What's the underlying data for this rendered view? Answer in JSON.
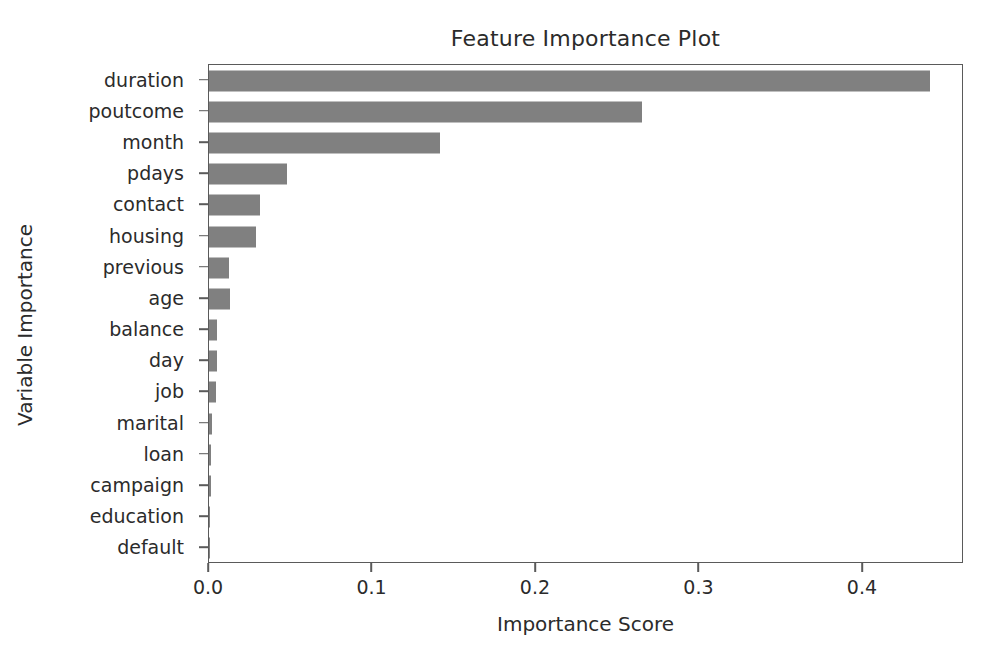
{
  "chart_data": {
    "type": "bar",
    "orientation": "horizontal",
    "title": "Feature Importance Plot",
    "xlabel": "Importance Score",
    "ylabel": "Variable Importance",
    "categories": [
      "duration",
      "poutcome",
      "month",
      "pdays",
      "contact",
      "housing",
      "previous",
      "age",
      "balance",
      "day",
      "job",
      "marital",
      "loan",
      "campaign",
      "education",
      "default"
    ],
    "values": [
      0.441,
      0.265,
      0.141,
      0.048,
      0.031,
      0.029,
      0.012,
      0.013,
      0.005,
      0.005,
      0.004,
      0.002,
      0.001,
      0.001,
      0.0005,
      0.0003
    ],
    "xlim": [
      0.0,
      0.4618
    ],
    "xticks": [
      0.0,
      0.1,
      0.2,
      0.3,
      0.4
    ],
    "xticklabels": [
      "0.0",
      "0.1",
      "0.2",
      "0.3",
      "0.4"
    ],
    "grid": false,
    "legend": null,
    "bar_color": "#808080",
    "axes_color": "#5a5a5a",
    "background_color": "#ffffff"
  }
}
